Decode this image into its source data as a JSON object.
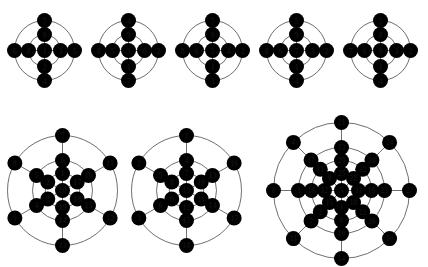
{
  "figure": {
    "background": "#ffffff",
    "node_fill": "#ffffff",
    "node_stroke": "#3a3a3a",
    "edge_color": "#4a4a4a",
    "width": 428,
    "height": 267
  },
  "graphs": [
    {
      "id": "graph-1",
      "name": "top-graph-1",
      "row": "top",
      "kind": "wheel-9",
      "cx": 44,
      "cy": 50,
      "radii": [
        0,
        16,
        30
      ],
      "node_rx": 7.5,
      "node_ry": 7.5,
      "font_size": 8.5,
      "center": "1",
      "inner": {
        "top": "9",
        "right": "3",
        "bottom": "2",
        "left": "8"
      },
      "outer": {
        "top": "7",
        "right": "5",
        "bottom": "4",
        "left": "6"
      },
      "labels_all": [
        "1",
        "9",
        "3",
        "2",
        "8",
        "7",
        "5",
        "4",
        "6"
      ]
    },
    {
      "id": "graph-2",
      "name": "top-graph-2",
      "row": "top",
      "kind": "wheel-9",
      "cx": 128,
      "cy": 50,
      "radii": [
        0,
        16,
        30
      ],
      "node_rx": 7.5,
      "node_ry": 7.5,
      "font_size": 8.5,
      "center": "3",
      "inner": {
        "top": "9",
        "right": "6",
        "bottom": "1",
        "left": "5"
      },
      "outer": {
        "top": "4",
        "right": "2",
        "bottom": "7",
        "left": "8"
      },
      "labels_all": [
        "3",
        "9",
        "6",
        "1",
        "5",
        "4",
        "2",
        "7",
        "8"
      ]
    },
    {
      "id": "graph-3",
      "name": "top-graph-3",
      "row": "top",
      "kind": "wheel-9",
      "cx": 212,
      "cy": 50,
      "radii": [
        0,
        16,
        30
      ],
      "node_rx": 7.5,
      "node_ry": 7.5,
      "font_size": 8.5,
      "center": "5",
      "inner": {
        "top": "9",
        "right": "4",
        "bottom": "1",
        "left": "6"
      },
      "outer": {
        "top": "7",
        "right": "2",
        "bottom": "3",
        "left": "8"
      },
      "labels_all": [
        "5",
        "9",
        "4",
        "1",
        "6",
        "7",
        "2",
        "3",
        "8"
      ]
    },
    {
      "id": "graph-4",
      "name": "top-graph-4",
      "row": "top",
      "kind": "wheel-9",
      "cx": 296,
      "cy": 50,
      "radii": [
        0,
        16,
        30
      ],
      "node_rx": 7.5,
      "node_ry": 7.5,
      "font_size": 8.5,
      "center": "7",
      "inner": {
        "top": "9",
        "right": "3",
        "bottom": "1",
        "left": "6"
      },
      "outer": {
        "top": "5",
        "right": "2",
        "bottom": "4",
        "left": "8"
      },
      "labels_all": [
        "7",
        "9",
        "3",
        "1",
        "6",
        "5",
        "2",
        "4",
        "8"
      ]
    },
    {
      "id": "graph-5",
      "name": "top-graph-5",
      "row": "top",
      "kind": "wheel-9",
      "cx": 380,
      "cy": 50,
      "radii": [
        0,
        16,
        30
      ],
      "node_rx": 7.5,
      "node_ry": 7.5,
      "font_size": 8.5,
      "center": "9",
      "inner": {
        "top": "8",
        "right": "3",
        "bottom": "1",
        "left": "6"
      },
      "outer": {
        "top": "5",
        "right": "2",
        "bottom": "4",
        "left": "7"
      },
      "labels_all": [
        "9",
        "8",
        "3",
        "1",
        "6",
        "5",
        "2",
        "4",
        "7"
      ]
    },
    {
      "id": "graph-6",
      "name": "bottom-graph-1",
      "row": "bottom",
      "kind": "hex-19",
      "cx": 62,
      "cy": 190,
      "radii": [
        0,
        17,
        30,
        43,
        55
      ],
      "node_rx": 7.5,
      "node_ry": 7.5,
      "font_size": 8,
      "center": "10",
      "ring1": [
        "1",
        "17",
        "18",
        "19",
        "3",
        "2"
      ],
      "ring2": [
        "6",
        "16",
        "15",
        "14",
        "4",
        "5"
      ],
      "ring3": [
        "7",
        "11",
        "12",
        "13",
        "9",
        "8"
      ],
      "labels_all": [
        "10",
        "1",
        "17",
        "18",
        "19",
        "3",
        "2",
        "6",
        "16",
        "15",
        "14",
        "4",
        "5",
        "7",
        "11",
        "12",
        "13",
        "9",
        "8"
      ]
    },
    {
      "id": "graph-7",
      "name": "bottom-graph-2",
      "row": "bottom",
      "kind": "hex-19",
      "cx": 186,
      "cy": 190,
      "radii": [
        0,
        17,
        30,
        43,
        55
      ],
      "node_rx": 7.5,
      "node_ry": 7.5,
      "font_size": 8,
      "center": "19",
      "ring1": [
        "7",
        "10",
        "11",
        "12",
        "9",
        "8"
      ],
      "ring2": [
        "4",
        "13",
        "14",
        "15",
        "6",
        "5"
      ],
      "ring3": [
        "1",
        "16",
        "17",
        "18",
        "3",
        "2"
      ],
      "labels_all": [
        "19",
        "7",
        "10",
        "11",
        "12",
        "9",
        "8",
        "4",
        "13",
        "14",
        "15",
        "6",
        "5",
        "1",
        "16",
        "17",
        "18",
        "3",
        "2"
      ]
    },
    {
      "id": "graph-8",
      "name": "bottom-graph-3",
      "row": "bottom",
      "kind": "octa-33",
      "cx": 341,
      "cy": 190,
      "radii": [
        0,
        17,
        30,
        43,
        56,
        68
      ],
      "node_rx": 7.5,
      "node_ry": 7.5,
      "font_size": 7.5,
      "center": "5",
      "ring1": [
        "25",
        "28",
        "31",
        "18",
        "1",
        "15",
        "12",
        "9"
      ],
      "ring2": [
        "29",
        "32",
        "19",
        "22",
        "6",
        "2",
        "16",
        "13"
      ],
      "ring3": [
        "33",
        "20",
        "23",
        "26",
        "10",
        "7",
        "3",
        "17"
      ],
      "ring4": [
        "21",
        "24",
        "27",
        "30",
        "14",
        "11",
        "8",
        "4"
      ],
      "labels_all": [
        "5",
        "25",
        "28",
        "31",
        "18",
        "1",
        "15",
        "12",
        "9",
        "29",
        "32",
        "19",
        "22",
        "6",
        "2",
        "16",
        "13",
        "33",
        "20",
        "23",
        "26",
        "10",
        "7",
        "3",
        "17",
        "21",
        "24",
        "27",
        "30",
        "14",
        "11",
        "8",
        "4"
      ]
    }
  ]
}
